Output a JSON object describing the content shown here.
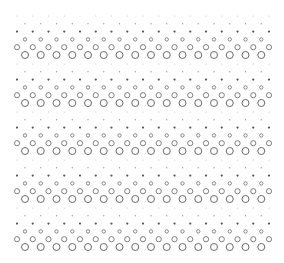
{
  "pattern": {
    "width": 284,
    "height": 263,
    "background": "#ffffff",
    "band_count": 5,
    "band_start_y": 16,
    "band_period": 48,
    "row_spacing": 7.8,
    "col_spacing": 15.75,
    "even_row_start_x": 17,
    "even_row_count": 17,
    "odd_row_start_x": 25,
    "odd_row_count": 16,
    "rows": [
      {
        "kind": "dot",
        "r": 0.6,
        "fill": "#c8c8c8"
      },
      {
        "kind": "dot",
        "r": 0.7,
        "fill": "#9a9a9a"
      },
      {
        "kind": "dot",
        "r": 1.1,
        "fill": "#555555"
      },
      {
        "kind": "ring",
        "r": 1.7,
        "stroke": "#7a7a7a",
        "stroke_width": 0.9
      },
      {
        "kind": "ring",
        "r": 2.6,
        "stroke": "#707070",
        "stroke_width": 0.9
      },
      {
        "kind": "ring",
        "r": 3.5,
        "stroke": "#6a6a6a",
        "stroke_width": 1.0
      }
    ]
  }
}
